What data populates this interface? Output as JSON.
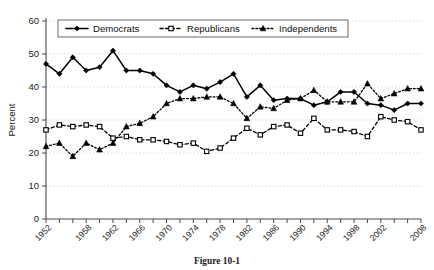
{
  "figure": {
    "caption": "Figure 10-1"
  },
  "chart_data": {
    "type": "line",
    "title": "",
    "xlabel": "",
    "ylabel": "Percent",
    "ylim": [
      0,
      60
    ],
    "yticks": [
      0,
      10,
      20,
      30,
      40,
      50,
      60
    ],
    "grid": true,
    "legend_position": "top-center",
    "x": [
      1952,
      1954,
      1956,
      1958,
      1960,
      1962,
      1964,
      1966,
      1968,
      1970,
      1972,
      1974,
      1976,
      1978,
      1980,
      1982,
      1984,
      1986,
      1988,
      1990,
      1992,
      1994,
      1996,
      1998,
      2000,
      2002,
      2004,
      2006,
      2008
    ],
    "xtick_labels": [
      "1952",
      "1958",
      "1962",
      "1966",
      "1970",
      "1974",
      "1978",
      "1982",
      "1986",
      "1990",
      "1994",
      "1998",
      "2002",
      "2008"
    ],
    "xtick_values": [
      1952,
      1958,
      1962,
      1966,
      1970,
      1974,
      1978,
      1982,
      1986,
      1990,
      1994,
      1998,
      2002,
      2008
    ],
    "series": [
      {
        "name": "Democrats",
        "marker": "diamond-filled",
        "line": "solid",
        "values": [
          47,
          44,
          49,
          45,
          46,
          51,
          45,
          45,
          44,
          40.5,
          38.5,
          40.5,
          39.5,
          41.5,
          44,
          37,
          40.5,
          36,
          36.5,
          36.5,
          34.5,
          35.5,
          38.5,
          38.5,
          35,
          34.5,
          33,
          35,
          35
        ]
      },
      {
        "name": "Republicans",
        "marker": "square-open",
        "line": "dashed",
        "values": [
          27,
          28.5,
          28,
          28.5,
          28,
          24.5,
          25,
          24,
          24,
          23.5,
          22.5,
          23,
          20.5,
          21.5,
          24.5,
          27.5,
          25.5,
          28,
          28.5,
          26,
          30.5,
          27,
          27,
          26.5,
          25,
          31,
          30,
          29.5,
          27
        ]
      },
      {
        "name": "Independents",
        "marker": "triangle-filled",
        "line": "dotted",
        "values": [
          22,
          23,
          19,
          23,
          21,
          23,
          28,
          29,
          31,
          35,
          36.5,
          36.5,
          37,
          37,
          35,
          30.5,
          34,
          33.5,
          36,
          36.5,
          39,
          35.5,
          35.5,
          35.5,
          41,
          36.5,
          38,
          39.5,
          39.5
        ]
      }
    ]
  }
}
